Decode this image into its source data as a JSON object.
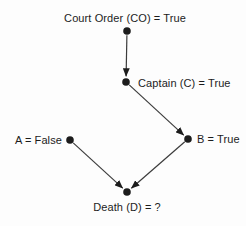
{
  "diagram": {
    "colors": {
      "background": "#fdfdfd",
      "ink": "#1c1c1c",
      "line": "#3c3c3c"
    },
    "node_radius": 3.8,
    "nodes": [
      {
        "id": "CO",
        "label": "Court Order (CO) = True",
        "x": 127,
        "y": 31,
        "label_x": 125,
        "label_y": 22,
        "anchor": "middle"
      },
      {
        "id": "C",
        "label": "Captain (C) = True",
        "x": 126,
        "y": 82,
        "label_x": 138,
        "label_y": 87,
        "anchor": "start"
      },
      {
        "id": "A",
        "label": "A = False",
        "x": 70,
        "y": 140,
        "label_x": 62,
        "label_y": 144,
        "anchor": "end"
      },
      {
        "id": "B",
        "label": "B = True",
        "x": 188,
        "y": 139,
        "label_x": 197,
        "label_y": 143,
        "anchor": "start"
      },
      {
        "id": "D",
        "label": "Death (D) = ?",
        "x": 127,
        "y": 192,
        "label_x": 127,
        "label_y": 211,
        "anchor": "middle"
      }
    ],
    "edges": [
      {
        "from": "CO",
        "to": "C"
      },
      {
        "from": "C",
        "to": "B"
      },
      {
        "from": "A",
        "to": "D"
      },
      {
        "from": "B",
        "to": "D"
      }
    ]
  }
}
